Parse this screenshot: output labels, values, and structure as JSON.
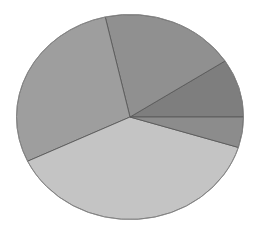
{
  "chart_data": {
    "type": "pie",
    "title": "",
    "xlabel": "",
    "ylabel": "",
    "legend": "none",
    "data_labels": "none",
    "values_are_estimated": true,
    "note": "No labels, legend, or values are shown in the image; proportions are estimated from slice boundary angles.",
    "center": [
      130,
      117
    ],
    "radius_x": 113.5,
    "radius_y": 102.5,
    "start_angle_deg": 0,
    "direction": "counterclockwise",
    "slices": [
      {
        "name": "Slice 1 (right, upper)",
        "value": 9.2,
        "color": "#7e7e7e"
      },
      {
        "name": "Slice 2 (top)",
        "value": 19.3,
        "color": "#909090"
      },
      {
        "name": "Slice 3 (left)",
        "value": 28.6,
        "color": "#9e9e9e"
      },
      {
        "name": "Slice 4 (bottom)",
        "value": 38.1,
        "color": "#c4c4c4"
      },
      {
        "name": "Slice 5 (right, lower)",
        "value": 4.8,
        "color": "#8c8c8c"
      }
    ]
  }
}
